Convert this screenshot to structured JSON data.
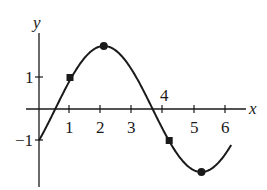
{
  "chart_data": {
    "type": "line",
    "title": "",
    "xlabel": "x",
    "ylabel": "y",
    "function": "y = 2 sin(x - π/6)",
    "xlim": [
      -0.3,
      6.9
    ],
    "ylim": [
      -2.3,
      2.8
    ],
    "x_ticks": [
      1,
      2,
      3,
      4,
      5,
      6
    ],
    "x_tick_labels": [
      "1",
      "2",
      "3",
      "4",
      "5",
      "6"
    ],
    "y_ticks": [
      1,
      -1
    ],
    "y_tick_labels": [
      "1",
      "−1"
    ],
    "grid": false,
    "legend": null,
    "series": [
      {
        "name": "curve",
        "x": [
          0,
          0.5,
          1,
          1.5,
          2,
          2.5,
          3,
          3.5,
          4,
          4.5,
          5,
          5.5,
          6,
          6.2
        ],
        "values": [
          -1.0,
          -0.04,
          0.92,
          1.67,
          1.99,
          1.83,
          1.22,
          0.33,
          -0.64,
          -1.47,
          -1.95,
          -1.93,
          -1.41,
          -1.13
        ]
      }
    ],
    "marked_points": [
      {
        "x": 1,
        "y": 1,
        "marker": "square"
      },
      {
        "x": 2.09,
        "y": 2,
        "marker": "circle"
      },
      {
        "x": 4.2,
        "y": -1,
        "marker": "square"
      },
      {
        "x": 5.24,
        "y": -2,
        "marker": "circle"
      }
    ]
  },
  "labels": {
    "x_axis": "x",
    "y_axis": "y",
    "xt1": "1",
    "xt2": "2",
    "xt3": "3",
    "xt4": "4",
    "xt5": "5",
    "xt6": "6",
    "yt_pos1": "1",
    "yt_neg1": "−1"
  }
}
